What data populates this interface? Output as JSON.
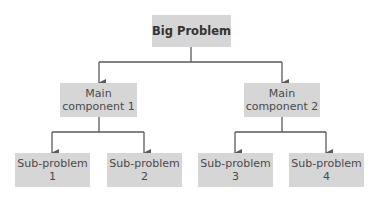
{
  "diagram": {
    "type": "hierarchy-tree",
    "root": {
      "label": "Big Problem"
    },
    "components": [
      {
        "label": "Main\ncomponent 1"
      },
      {
        "label": "Main\ncomponent 2"
      }
    ],
    "subproblems": [
      {
        "label": "Sub-problem\n1"
      },
      {
        "label": "Sub-problem\n2"
      },
      {
        "label": "Sub-problem\n3"
      },
      {
        "label": "Sub-problem\n4"
      }
    ],
    "colors": {
      "box_fill": "#d6d6d6",
      "line": "#5a5a5a",
      "text": "#4a4a4a"
    }
  }
}
